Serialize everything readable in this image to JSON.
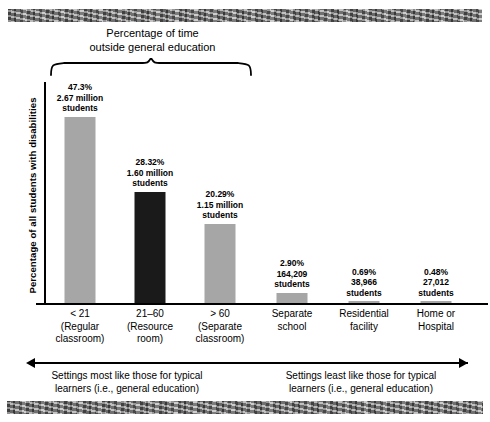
{
  "chart_data": {
    "type": "bar",
    "title": "Percentage of time outside general education",
    "title_line1": "Percentage of time",
    "title_line2": "outside general education",
    "xlabel": "",
    "ylabel": "Percentage of all students with disabilities",
    "ylim": [
      0,
      50
    ],
    "grid": false,
    "legend": "none",
    "categories": [
      "< 21 (Regular classroom)",
      "21–60 (Resource room)",
      "> 60 (Separate classroom)",
      "Separate school",
      "Residential facility",
      "Home or Hospital"
    ],
    "values": [
      47.3,
      28.32,
      20.29,
      2.9,
      0.69,
      0.48
    ],
    "counts": [
      "2.67 million students",
      "1.60 million students",
      "1.15 million students",
      "164,209 students",
      "38,966 students",
      "27,012 students"
    ],
    "bars": [
      {
        "pct": "47.3%",
        "count_line1": "2.67 million",
        "count_line2": "students",
        "value": 47.3,
        "color": "#a6a6a6",
        "cat_line1": "< 21",
        "cat_line2": "(Regular",
        "cat_line3": "classroom)"
      },
      {
        "pct": "28.32%",
        "count_line1": "1.60 million",
        "count_line2": "students",
        "value": 28.32,
        "color": "#1a1a1a",
        "cat_line1": "21–60",
        "cat_line2": "(Resource",
        "cat_line3": "room)"
      },
      {
        "pct": "20.29%",
        "count_line1": "1.15 million",
        "count_line2": "students",
        "value": 20.29,
        "color": "#a6a6a6",
        "cat_line1": "> 60",
        "cat_line2": "(Separate",
        "cat_line3": "classroom)"
      },
      {
        "pct": "2.90%",
        "count_line1": "164,209",
        "count_line2": "students",
        "value": 2.9,
        "color": "#a6a6a6",
        "cat_line1": "Separate",
        "cat_line2": "school",
        "cat_line3": ""
      },
      {
        "pct": "0.69%",
        "count_line1": "38,966",
        "count_line2": "students",
        "value": 0.69,
        "color": "#a6a6a6",
        "cat_line1": "Residential",
        "cat_line2": "facility",
        "cat_line3": ""
      },
      {
        "pct": "0.48%",
        "count_line1": "27,012",
        "count_line2": "students",
        "value": 0.48,
        "color": "#a6a6a6",
        "cat_line1": "Home or",
        "cat_line2": "Hospital",
        "cat_line3": ""
      }
    ],
    "annotations": {
      "left_line1": "Settings most like those for typical",
      "left_line2": "learners (i.e., general education)",
      "right_line1": "Settings least like those for typical",
      "right_line2": "learners (i.e., general education)"
    },
    "colors": {
      "bar_gray": "#a6a6a6",
      "bar_dark": "#1a1a1a",
      "axis": "#000000",
      "background": "#ffffff"
    }
  }
}
